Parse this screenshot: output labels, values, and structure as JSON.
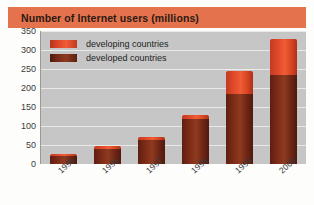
{
  "title": "Number of Internet users (millions)",
  "legend": {
    "items": [
      {
        "label": "developing countries",
        "swatch": "developing-swatch",
        "color": "#e04a2a"
      },
      {
        "label": "developed countries",
        "swatch": "developed-swatch",
        "color": "#7e2c17"
      }
    ]
  },
  "colors": {
    "banner": "#e4724c",
    "plot_background": "#c6c6c6",
    "gridline": "#e9e9e6",
    "developing": "#e04a2a",
    "developed": "#7e2c17"
  },
  "chart_data": {
    "type": "bar",
    "title": "Number of Internet users (millions)",
    "xlabel": "",
    "ylabel": "",
    "ylim": [
      0,
      350
    ],
    "yticks": [
      0,
      50,
      100,
      150,
      200,
      250,
      300,
      350
    ],
    "ytick_labels": [
      "0",
      "50",
      "100",
      "150",
      "200",
      "250",
      "300",
      "350"
    ],
    "grid": true,
    "stacked": true,
    "legend_position": "top-left inside plot",
    "categories": [
      "1995",
      "1996",
      "1997",
      "1998",
      "1999",
      "2000"
    ],
    "series": [
      {
        "name": "developed countries",
        "color": "#7e2c17",
        "values": [
          20,
          40,
          62,
          118,
          185,
          235
        ]
      },
      {
        "name": "developing countries",
        "color": "#e04a2a",
        "values": [
          5,
          8,
          10,
          12,
          60,
          95
        ]
      }
    ],
    "totals": [
      25,
      48,
      72,
      130,
      245,
      330
    ]
  }
}
